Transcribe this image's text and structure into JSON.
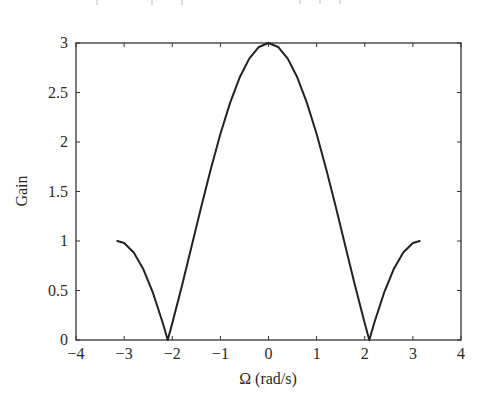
{
  "chart_data": {
    "type": "line",
    "title": "",
    "xlabel": "Ω (rad/s)",
    "ylabel": "Gain",
    "xlim": [
      -4,
      4
    ],
    "ylim": [
      0,
      3
    ],
    "grid": false,
    "legend": null,
    "xticks": [
      -4,
      -3,
      -2,
      -1,
      0,
      1,
      2,
      3,
      4
    ],
    "xtick_labels": [
      "−4",
      "−3",
      "−2",
      "−1",
      "0",
      "1",
      "2",
      "3",
      "4"
    ],
    "yticks": [
      0,
      0.5,
      1,
      1.5,
      2,
      2.5,
      3
    ],
    "ytick_labels": [
      "0",
      "0.5",
      "1",
      "1.5",
      "2",
      "2.5",
      "3"
    ],
    "series": [
      {
        "name": "Gain |1 + 2cos(Ω)|",
        "color": "#222222",
        "x": [
          -3.1416,
          -3.0,
          -2.8,
          -2.6,
          -2.4,
          -2.2,
          -2.0944,
          -2.0,
          -1.8,
          -1.6,
          -1.4,
          -1.2,
          -1.0,
          -0.8,
          -0.6,
          -0.4,
          -0.2,
          0.0,
          0.2,
          0.4,
          0.6,
          0.8,
          1.0,
          1.2,
          1.4,
          1.6,
          1.8,
          2.0,
          2.0944,
          2.2,
          2.4,
          2.6,
          2.8,
          3.0,
          3.1416
        ],
        "y": [
          1.0,
          0.98,
          0.884,
          0.714,
          0.475,
          0.177,
          0.0,
          0.168,
          0.545,
          0.942,
          1.34,
          1.725,
          2.081,
          2.393,
          2.651,
          2.842,
          2.96,
          3.0,
          2.96,
          2.842,
          2.651,
          2.393,
          2.081,
          1.725,
          1.34,
          0.942,
          0.545,
          0.168,
          0.0,
          0.177,
          0.475,
          0.714,
          0.884,
          0.98,
          1.0
        ]
      }
    ],
    "annotations": []
  },
  "colors": {
    "axis": "#333333",
    "line": "#222222",
    "background": "#ffffff"
  }
}
